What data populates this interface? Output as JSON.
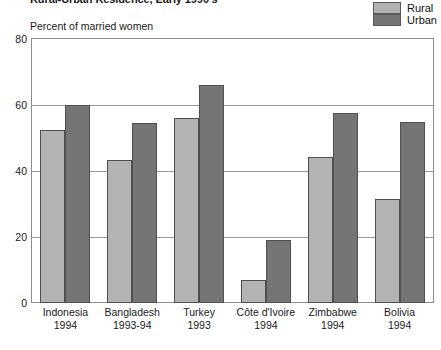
{
  "chart_data": {
    "type": "bar",
    "title": "Rural-Urban Residence, Early 1990's",
    "subtitle": "Percent of married women",
    "xlabel": "",
    "ylabel": "Percent of married women",
    "ylim": [
      0,
      80
    ],
    "yticks": [
      0,
      20,
      40,
      60,
      80
    ],
    "grid": true,
    "legend_position": "top-right",
    "categories": [
      "Indonesia 1994",
      "Bangladesh 1993-94",
      "Turkey 1993",
      "Côte d'Ivoire 1994",
      "Zimbabwe 1994",
      "Bolivia 1994"
    ],
    "category_lines": [
      {
        "country": "Indonesia",
        "year": "1994"
      },
      {
        "country": "Bangladesh",
        "year": "1993-94"
      },
      {
        "country": "Turkey",
        "year": "1993"
      },
      {
        "country": "Côte d'Ivoire",
        "year": "1994"
      },
      {
        "country": "Zimbabwe",
        "year": "1994"
      },
      {
        "country": "Bolivia",
        "year": "1994"
      }
    ],
    "series": [
      {
        "name": "Rural",
        "color": "#b3b3b3",
        "values": [
          52.5,
          43.3,
          56.0,
          7.0,
          44.2,
          31.5
        ]
      },
      {
        "name": "Urban",
        "color": "#757575",
        "values": [
          60.0,
          54.4,
          66.0,
          19.2,
          57.5,
          55.0
        ]
      }
    ]
  },
  "legend": {
    "items": [
      {
        "label": "Rural",
        "color": "#b3b3b3"
      },
      {
        "label": "Urban",
        "color": "#757575"
      }
    ]
  },
  "axis": {
    "caption": "Percent of married women",
    "yticks": [
      "80",
      "60",
      "40",
      "20",
      "0"
    ]
  },
  "colors": {
    "rural": "#b3b3b3",
    "urban": "#757575",
    "frame": "#8c8c8c",
    "gridline": "#9a9a9a",
    "bar_border": "#4f4f4f",
    "text": "#1a1a1a",
    "background": "#ffffff"
  }
}
